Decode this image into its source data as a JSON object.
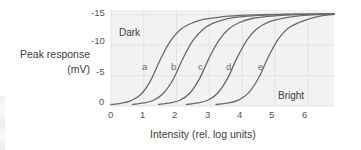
{
  "chart_data": {
    "type": "line",
    "title": "",
    "subtitle": "",
    "xlabel": "Intensity (rel. log units)",
    "ylabel_line1": "Peak response",
    "ylabel_line2": "(mV)",
    "xlim": [
      0,
      6.8
    ],
    "ylim": [
      0,
      -15.8
    ],
    "xticks": [
      "0",
      "1",
      "2",
      "3",
      "4",
      "5",
      "6"
    ],
    "xtick_values": [
      0,
      1,
      2,
      3,
      4,
      5,
      6
    ],
    "yticks": [
      "0",
      "-5",
      "-10",
      "-15"
    ],
    "ytick_values": [
      0,
      -5,
      -10,
      -15
    ],
    "grid": true,
    "grid_color": "#e3e3e3",
    "plot_background": "#f2f2f2",
    "curve_color": "#6b6b6b",
    "legend_position": "inline-labels",
    "annotations": [
      {
        "text": "Dark",
        "x": 0.35,
        "y": -11.6
      },
      {
        "text": "Bright",
        "x": 5.15,
        "y": -1.7
      }
    ],
    "series": [
      {
        "name": "a",
        "label_x": 0.95,
        "label_y": -5.6,
        "midpoint": 1.35,
        "slope": 1.55,
        "vmax": -15.0,
        "x_start": 0.0,
        "x_end": 6.8,
        "points_x": [
          0.0,
          0.3,
          0.6,
          0.9,
          1.2,
          1.5,
          1.8,
          2.1,
          2.4,
          2.7,
          3.0,
          3.6,
          4.4,
          5.4,
          6.8
        ],
        "points_y": [
          -0.25,
          -0.45,
          -0.85,
          -1.85,
          -4.1,
          -7.6,
          -10.6,
          -12.5,
          -13.5,
          -14.1,
          -14.4,
          -14.8,
          -15.0,
          -15.1,
          -15.15
        ]
      },
      {
        "name": "b",
        "label_x": 1.85,
        "label_y": -5.6,
        "midpoint": 2.15,
        "slope": 1.55,
        "vmax": -15.0,
        "x_start": 0.65,
        "x_end": 6.8,
        "points_x": [
          0.65,
          1.0,
          1.3,
          1.6,
          1.9,
          2.2,
          2.5,
          2.8,
          3.1,
          3.5,
          4.0,
          4.8,
          5.8,
          6.8
        ],
        "points_y": [
          -0.25,
          -0.5,
          -0.95,
          -2.1,
          -4.4,
          -7.9,
          -10.8,
          -12.6,
          -13.6,
          -14.3,
          -14.7,
          -15.0,
          -15.1,
          -15.15
        ]
      },
      {
        "name": "c",
        "label_x": 2.7,
        "label_y": -5.6,
        "midpoint": 2.95,
        "slope": 1.55,
        "vmax": -15.0,
        "x_start": 1.45,
        "x_end": 6.8,
        "points_x": [
          1.45,
          1.8,
          2.1,
          2.4,
          2.7,
          3.0,
          3.3,
          3.6,
          3.9,
          4.3,
          4.9,
          5.7,
          6.8
        ],
        "points_y": [
          -0.25,
          -0.5,
          -0.95,
          -2.1,
          -4.5,
          -8.0,
          -10.9,
          -12.7,
          -13.7,
          -14.4,
          -14.8,
          -15.05,
          -15.15
        ]
      },
      {
        "name": "d",
        "label_x": 3.55,
        "label_y": -5.6,
        "midpoint": 3.8,
        "slope": 1.55,
        "vmax": -15.0,
        "x_start": 2.3,
        "x_end": 6.8,
        "points_x": [
          2.3,
          2.65,
          2.95,
          3.25,
          3.55,
          3.85,
          4.15,
          4.45,
          4.8,
          5.3,
          6.0,
          6.8
        ],
        "points_y": [
          -0.25,
          -0.5,
          -0.95,
          -2.1,
          -4.5,
          -8.0,
          -10.9,
          -12.7,
          -13.8,
          -14.5,
          -14.95,
          -15.15
        ]
      },
      {
        "name": "e",
        "label_x": 4.55,
        "label_y": -5.6,
        "midpoint": 4.75,
        "slope": 1.55,
        "vmax": -15.0,
        "x_start": 3.2,
        "x_end": 6.8,
        "points_x": [
          3.2,
          3.6,
          3.9,
          4.2,
          4.5,
          4.8,
          5.1,
          5.4,
          5.8,
          6.3,
          6.8
        ],
        "points_y": [
          -0.25,
          -0.5,
          -1.0,
          -2.2,
          -4.6,
          -8.1,
          -11.0,
          -12.8,
          -13.9,
          -14.7,
          -15.1
        ]
      }
    ]
  }
}
